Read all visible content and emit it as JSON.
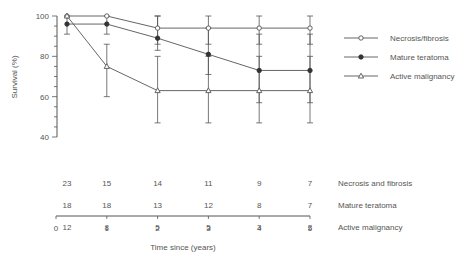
{
  "chart_data": {
    "type": "line",
    "title": "",
    "xlabel": "Time since (years)",
    "ylabel": "Survival (%)",
    "ylim": [
      40,
      100
    ],
    "xlim": [
      0,
      5
    ],
    "y_ticks": [
      40,
      60,
      80,
      100
    ],
    "x_ticks": [
      0,
      1,
      2,
      3,
      4,
      5
    ],
    "grid": false,
    "legend_position": "right",
    "x": [
      0,
      1,
      2,
      3,
      4,
      5
    ],
    "series": [
      {
        "name": "Necrosis/fibrosis",
        "marker": "open-circle",
        "values": [
          100,
          100,
          94,
          94,
          94,
          94
        ],
        "error_upper": [
          100,
          100,
          100,
          100,
          100,
          100
        ],
        "error_lower": [
          100,
          100,
          86,
          86,
          86,
          86
        ]
      },
      {
        "name": "Mature teratoma",
        "marker": "filled-circle",
        "values": [
          96,
          96,
          89,
          81,
          73,
          73
        ],
        "error_upper": [
          100,
          100,
          100,
          94,
          91,
          91
        ],
        "error_lower": [
          91,
          91,
          83,
          71,
          57,
          57
        ]
      },
      {
        "name": "Active malignancy",
        "marker": "open-triangle",
        "values": [
          100,
          75,
          63,
          63,
          63,
          63
        ],
        "error_upper": [
          100,
          86,
          80,
          80,
          80,
          80
        ],
        "error_lower": [
          100,
          60,
          47,
          47,
          47,
          47
        ]
      }
    ],
    "at_risk_table": {
      "rows": [
        {
          "label": "Necrosis and fibrosis",
          "values": [
            23,
            15,
            14,
            11,
            9,
            7
          ]
        },
        {
          "label": "Mature teratoma",
          "values": [
            18,
            18,
            13,
            12,
            8,
            7
          ]
        },
        {
          "label": "Active malignancy",
          "values": [
            12,
            8,
            5,
            5,
            3,
            2
          ]
        }
      ]
    }
  }
}
